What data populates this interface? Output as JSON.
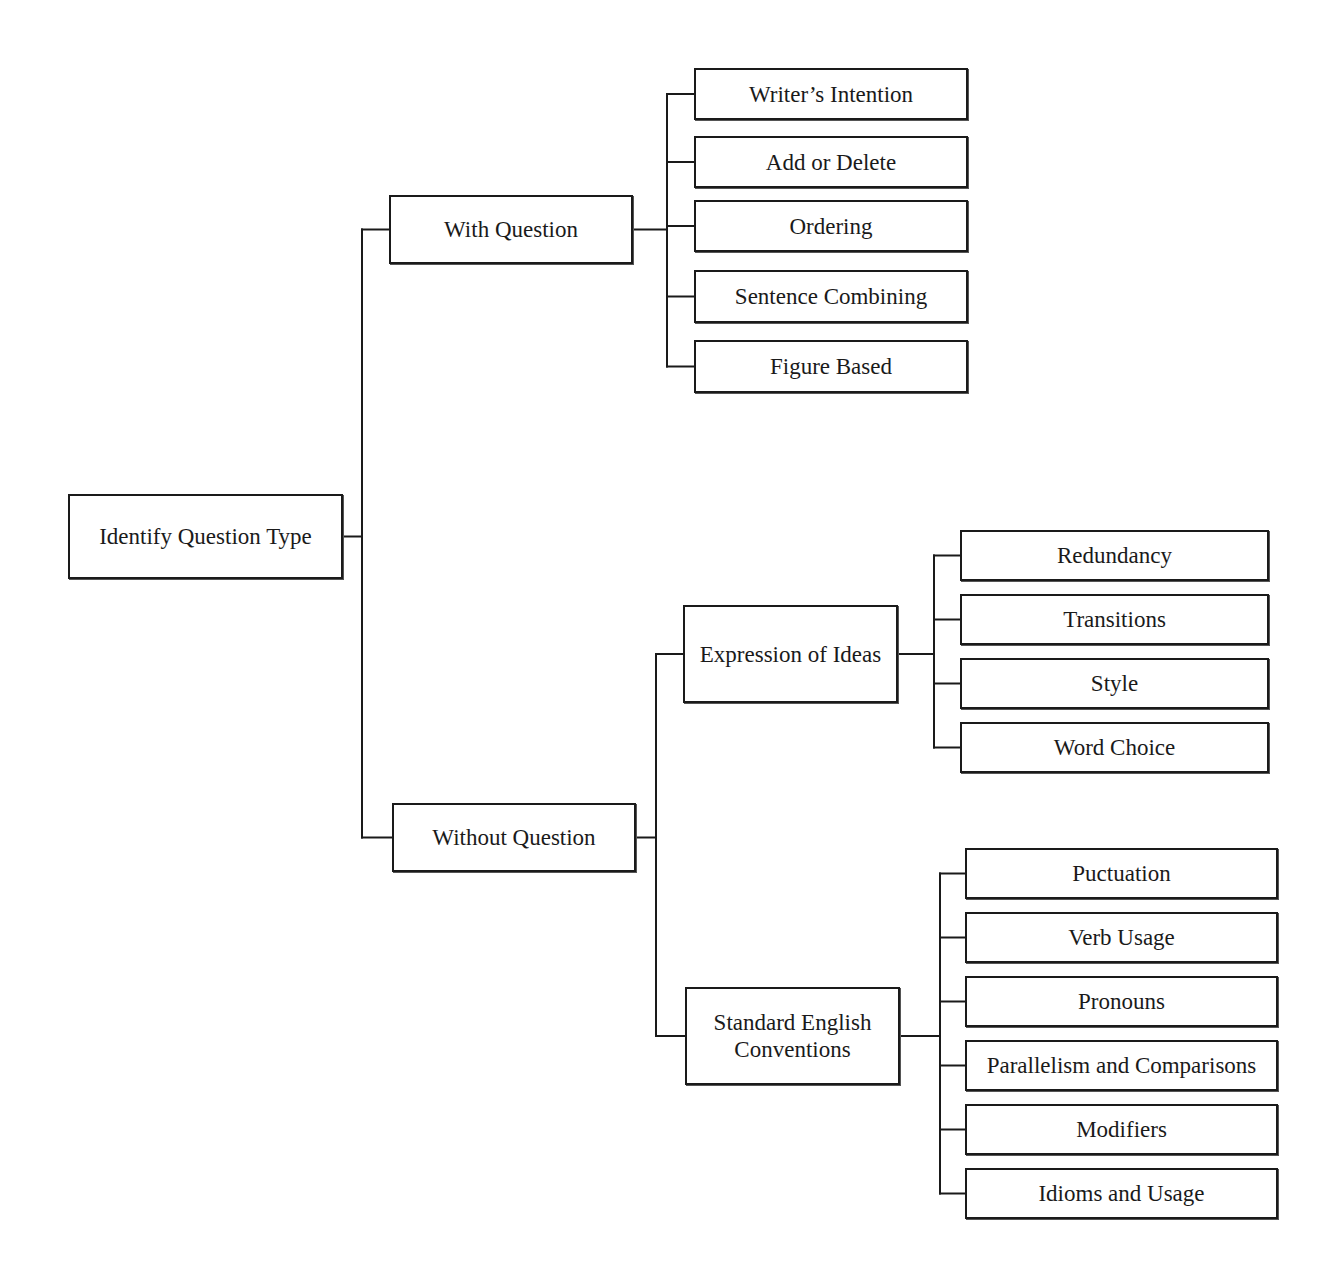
{
  "diagram": {
    "root": {
      "id": "root",
      "label": "Identify Question Type",
      "box": [
        68,
        494,
        275,
        85
      ]
    },
    "nodes": [
      {
        "id": "with-question",
        "label": "With Question",
        "box": [
          389,
          195,
          244,
          69
        ],
        "parent": "root"
      },
      {
        "id": "without-question",
        "label": "Without Question",
        "box": [
          392,
          803,
          244,
          69
        ],
        "parent": "root"
      },
      {
        "id": "writers-intention",
        "label": "Writer’s Intention",
        "box": [
          694,
          68,
          274,
          52
        ],
        "parent": "with-question"
      },
      {
        "id": "add-or-delete",
        "label": "Add or Delete",
        "box": [
          694,
          136,
          274,
          52
        ],
        "parent": "with-question"
      },
      {
        "id": "ordering",
        "label": "Ordering",
        "box": [
          694,
          200,
          274,
          52
        ],
        "parent": "with-question"
      },
      {
        "id": "sentence-combining",
        "label": "Sentence Combining",
        "box": [
          694,
          270,
          274,
          53
        ],
        "parent": "with-question"
      },
      {
        "id": "figure-based",
        "label": "Figure Based",
        "box": [
          694,
          340,
          274,
          53
        ],
        "parent": "with-question"
      },
      {
        "id": "expression-of-ideas",
        "label": "Expression of Ideas",
        "box": [
          683,
          605,
          215,
          98
        ],
        "parent": "without-question"
      },
      {
        "id": "standard-english-conventions",
        "label": "Standard English\nConventions",
        "box": [
          685,
          987,
          215,
          98
        ],
        "parent": "without-question"
      },
      {
        "id": "redundancy",
        "label": "Redundancy",
        "box": [
          960,
          530,
          309,
          51
        ],
        "parent": "expression-of-ideas"
      },
      {
        "id": "transitions",
        "label": "Transitions",
        "box": [
          960,
          594,
          309,
          51
        ],
        "parent": "expression-of-ideas"
      },
      {
        "id": "style",
        "label": "Style",
        "box": [
          960,
          658,
          309,
          51
        ],
        "parent": "expression-of-ideas"
      },
      {
        "id": "word-choice",
        "label": "Word Choice",
        "box": [
          960,
          722,
          309,
          51
        ],
        "parent": "expression-of-ideas"
      },
      {
        "id": "puctuation",
        "label": "Puctuation",
        "box": [
          965,
          848,
          313,
          51
        ],
        "parent": "standard-english-conventions"
      },
      {
        "id": "verb-usage",
        "label": "Verb Usage",
        "box": [
          965,
          912,
          313,
          51
        ],
        "parent": "standard-english-conventions"
      },
      {
        "id": "pronouns",
        "label": "Pronouns",
        "box": [
          965,
          976,
          313,
          51
        ],
        "parent": "standard-english-conventions"
      },
      {
        "id": "parallelism-and-comparisons",
        "label": "Parallelism and Comparisons",
        "box": [
          965,
          1040,
          313,
          51
        ],
        "parent": "standard-english-conventions"
      },
      {
        "id": "modifiers",
        "label": "Modifiers",
        "box": [
          965,
          1104,
          313,
          51
        ],
        "parent": "standard-english-conventions"
      },
      {
        "id": "idioms-and-usage",
        "label": "Idioms and Usage",
        "box": [
          965,
          1168,
          313,
          51
        ],
        "parent": "standard-english-conventions"
      }
    ],
    "spines": {
      "root": 362,
      "with-question": 667,
      "without-question": 656,
      "expression-of-ideas": 934,
      "standard-english-conventions": 940
    },
    "colors": {
      "line": "#1a1a1a",
      "box_border": "#1a1a1a",
      "text": "#1a1a1a",
      "background": "#ffffff"
    }
  }
}
